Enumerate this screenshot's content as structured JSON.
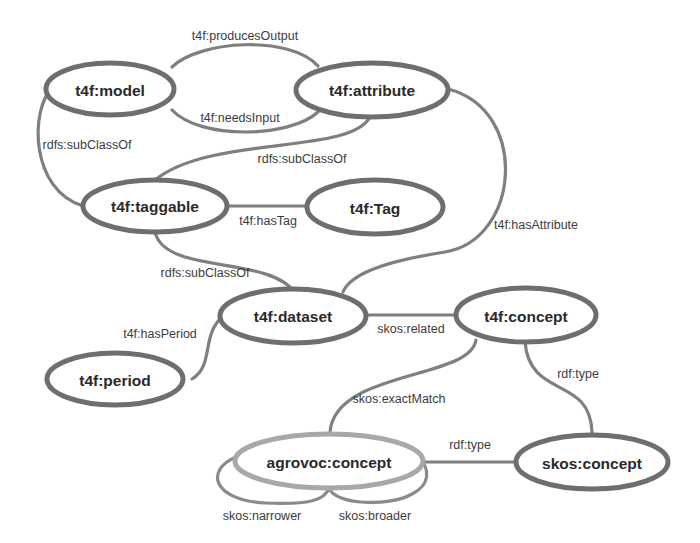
{
  "diagram": {
    "colors": {
      "node_stroke": "#6e6e6e",
      "node_stroke_external": "#a8a8a8",
      "edge_stroke": "#7f7f7f",
      "text": "#2a2a2a",
      "background": "#ffffff"
    },
    "nodes": {
      "model": "t4f:model",
      "attribute": "t4f:attribute",
      "taggable": "t4f:taggable",
      "tag": "t4f:Tag",
      "dataset": "t4f:dataset",
      "concept": "t4f:concept",
      "period": "t4f:period",
      "agrovoc_concept": "agrovoc:concept",
      "skos_concept": "skos:concept"
    },
    "edges": {
      "produces_output": "t4f:producesOutput",
      "needs_input": "t4f:needsInput",
      "model_subclass": "rdfs:subClassOf",
      "attribute_subclass": "rdfs:subClassOf",
      "has_tag": "t4f:hasTag",
      "has_attribute": "t4f:hasAttribute",
      "dataset_subclass": "rdfs:subClassOf",
      "has_period": "t4f:hasPeriod",
      "related": "skos:related",
      "exact_match": "skos:exactMatch",
      "concept_rdf_type": "rdf:type",
      "agrovoc_rdf_type": "rdf:type",
      "narrower": "skos:narrower",
      "broader": "skos:broader"
    }
  }
}
